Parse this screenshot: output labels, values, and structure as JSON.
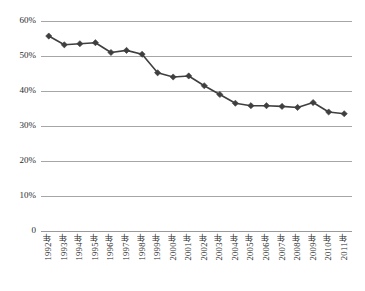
{
  "chart_data": {
    "type": "line",
    "title": "",
    "xlabel": "",
    "ylabel": "",
    "ylim": [
      0,
      60
    ],
    "ytick_labels": [
      "60%",
      "50%",
      "40%",
      "30%",
      "20%",
      "10%",
      "0"
    ],
    "ytick_values": [
      60,
      50,
      40,
      30,
      20,
      10,
      0
    ],
    "grid": true,
    "legend": "none",
    "categories": [
      "1992年",
      "1993年",
      "1994年",
      "1995年",
      "1996年",
      "1997年",
      "1998年",
      "1999年",
      "2000年",
      "2001年",
      "2002年",
      "2003年",
      "2004年",
      "2005年",
      "2006年",
      "2007年",
      "2008年",
      "2009年",
      "2010年",
      "2011年"
    ],
    "values": [
      55.7,
      53.2,
      53.5,
      53.8,
      51.0,
      51.6,
      50.5,
      45.2,
      44.0,
      44.3,
      41.5,
      39.0,
      36.5,
      35.8,
      35.8,
      35.6,
      35.3,
      36.7,
      34.0,
      33.5
    ],
    "series": [
      {
        "name": "series-1",
        "marker": "diamond",
        "color": "#3f3f3f",
        "values": [
          55.7,
          53.2,
          53.5,
          53.8,
          51.0,
          51.6,
          50.5,
          45.2,
          44.0,
          44.3,
          41.5,
          39.0,
          36.5,
          35.8,
          35.8,
          35.6,
          35.3,
          36.7,
          34.0,
          33.5
        ]
      }
    ]
  },
  "style": {
    "background": "#ffffff",
    "gridline_color": "#a6a6a6",
    "line_color": "#3f3f3f",
    "text_color": "#2b2b2b"
  }
}
